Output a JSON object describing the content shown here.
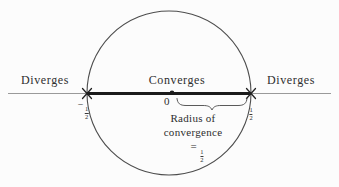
{
  "figure": {
    "title_semantic": "radius-of-convergence-diagram",
    "left_diverges": "Diverges",
    "converges": "Converges",
    "right_diverges": "Diverges",
    "origin": "0",
    "left_endpoint": {
      "sign": "−",
      "num": "1",
      "den": "2"
    },
    "right_endpoint": {
      "num": "1",
      "den": "2"
    },
    "radius_caption_line1": "Radius of",
    "radius_caption_line2": "convergence",
    "radius_value": {
      "eq": "=",
      "num": "1",
      "den": "2"
    }
  },
  "colors": {
    "background": "#fcfcfc",
    "circle_stroke": "#4d4d4d",
    "axis_line": "#9a9a9a",
    "convergence_segment": "#1b1b1b",
    "brace": "#5a5a5a",
    "text": "#2e2e2e"
  }
}
